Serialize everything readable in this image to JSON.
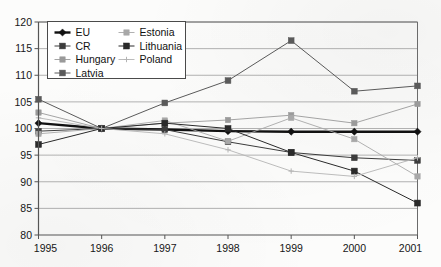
{
  "chart_data": {
    "type": "line",
    "title": "",
    "xlabel": "",
    "ylabel": "",
    "x": [
      1995,
      1996,
      1997,
      1998,
      1999,
      2000,
      2001
    ],
    "xtick_labels": [
      "1995",
      "1996",
      "1997",
      "1998",
      "1999",
      "2000",
      "2001"
    ],
    "ytick_labels": [
      "80",
      "85",
      "90",
      "95",
      "100",
      "105",
      "110",
      "115",
      "120"
    ],
    "yticks": [
      80,
      85,
      90,
      95,
      100,
      105,
      110,
      115,
      120
    ],
    "ylim": [
      80,
      120
    ],
    "xlim": [
      1995,
      2001
    ],
    "grid": "horizontal",
    "legend_position": "upper-left",
    "series": [
      {
        "name": "EU",
        "values": [
          101.0,
          100.0,
          99.8,
          99.5,
          99.4,
          99.4,
          99.4
        ],
        "color": "#111111",
        "width": 2.4,
        "marker": "diamond",
        "marker_size": 3.6
      },
      {
        "name": "CR",
        "values": [
          99.5,
          100.0,
          99.8,
          97.5,
          95.5,
          94.5,
          94.0
        ],
        "color": "#3c3c3c",
        "width": 1.0,
        "marker": "square",
        "marker_size": 2.9
      },
      {
        "name": "Hungary",
        "values": [
          103.0,
          100.0,
          101.0,
          101.6,
          102.5,
          101.0,
          104.6
        ],
        "color": "#9a9a9a",
        "width": 0.9,
        "marker": "square",
        "marker_size": 2.7
      },
      {
        "name": "Latvia",
        "values": [
          105.5,
          100.0,
          104.8,
          109.0,
          116.5,
          107.0,
          108.0
        ],
        "color": "#5a5a5a",
        "width": 1.0,
        "marker": "square",
        "marker_size": 2.9
      },
      {
        "name": "Estonia",
        "values": [
          99.0,
          100.0,
          101.5,
          97.6,
          102.0,
          98.0,
          91.0
        ],
        "color": "#a8a8a8",
        "width": 0.9,
        "marker": "square",
        "marker_size": 2.7
      },
      {
        "name": "Lithuania",
        "values": [
          97.0,
          100.0,
          101.0,
          100.0,
          95.5,
          92.0,
          86.0
        ],
        "color": "#2a2a2a",
        "width": 1.0,
        "marker": "square",
        "marker_size": 3.0
      },
      {
        "name": "Poland",
        "values": [
          102.0,
          100.0,
          99.0,
          96.0,
          92.0,
          91.0,
          94.5
        ],
        "color": "#b4b4b4",
        "width": 0.9,
        "marker": "plus",
        "marker_size": 2.7
      }
    ],
    "legend_entries": [
      {
        "label": "EU",
        "col": 0,
        "row": 0
      },
      {
        "label": "Estonia",
        "col": 1,
        "row": 0
      },
      {
        "label": "CR",
        "col": 0,
        "row": 1
      },
      {
        "label": "Lithuania",
        "col": 1,
        "row": 1
      },
      {
        "label": "Hungary",
        "col": 0,
        "row": 2
      },
      {
        "label": "Poland",
        "col": 1,
        "row": 2
      },
      {
        "label": "Latvia",
        "col": 0,
        "row": 3
      }
    ],
    "colors": {
      "axis": "#555555",
      "grid": "#9e9e9e",
      "frame": "#6b6b6b",
      "background": "#fdfdfc",
      "text": "#161616"
    }
  }
}
